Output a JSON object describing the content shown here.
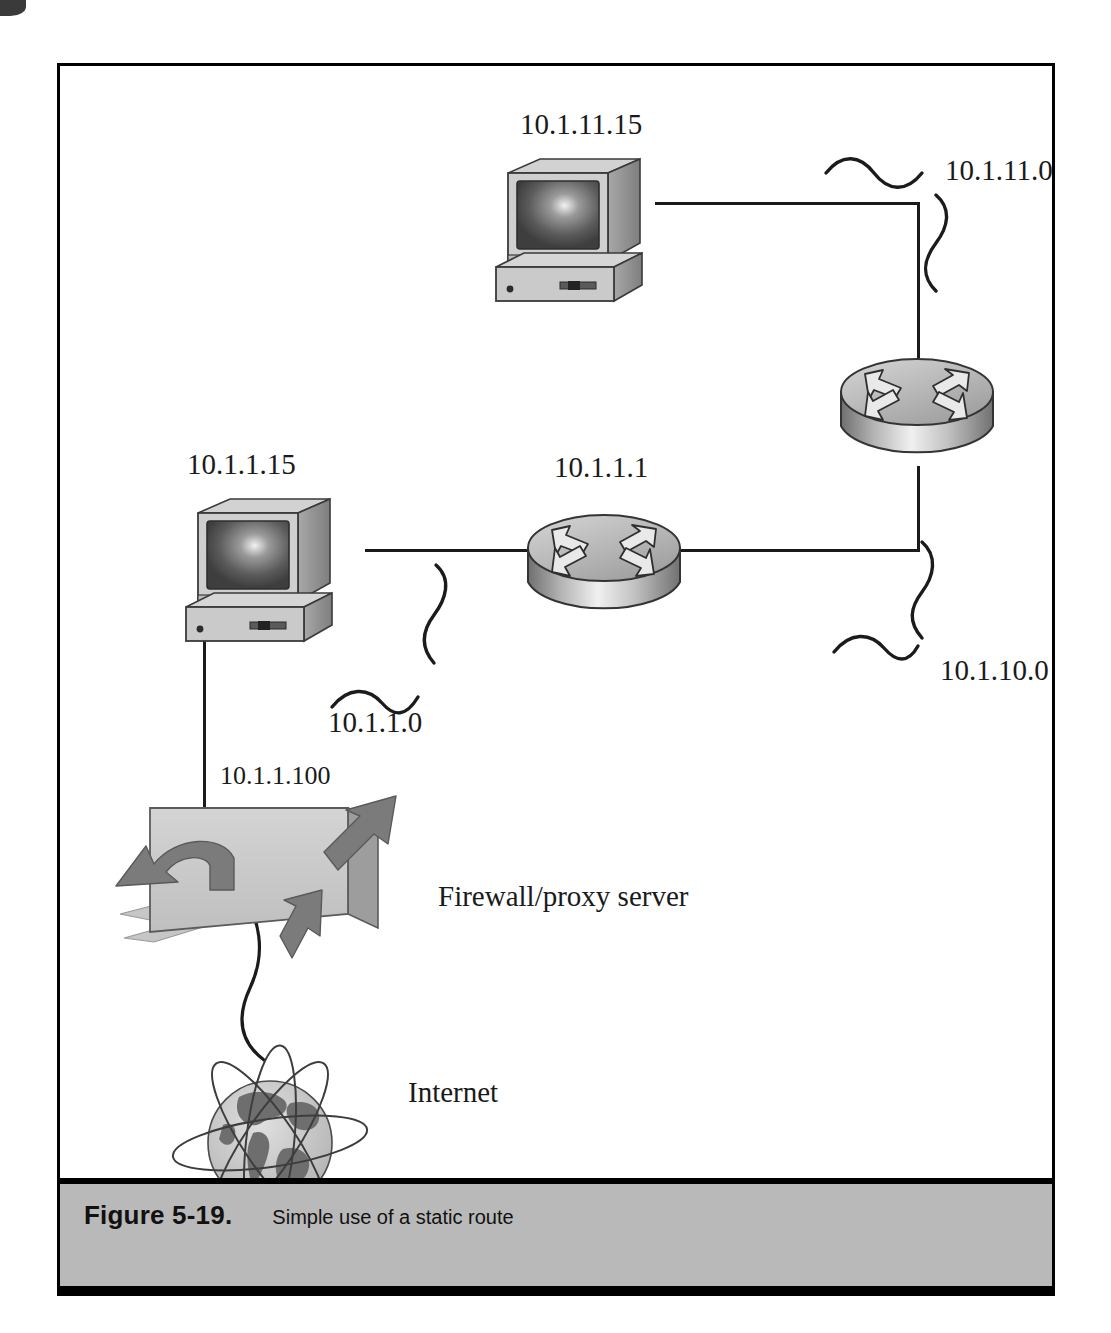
{
  "figure": {
    "number_label": "Figure 5-19.",
    "caption": "Simple use of a static route"
  },
  "diagram": {
    "title": "Simple use of a static route",
    "type": "network-topology",
    "nodes": [
      {
        "id": "pc-top",
        "kind": "workstation",
        "label": "10.1.11.15"
      },
      {
        "id": "router-top",
        "kind": "router",
        "label": ""
      },
      {
        "id": "pc-left",
        "kind": "workstation",
        "label": "10.1.1.15"
      },
      {
        "id": "router-mid",
        "kind": "router",
        "label": "10.1.1.1"
      },
      {
        "id": "firewall",
        "kind": "firewall-proxy",
        "label": "Firewall/proxy server",
        "ip": "10.1.1.100"
      },
      {
        "id": "internet",
        "kind": "internet-cloud",
        "label": "Internet"
      }
    ],
    "segments": [
      {
        "id": "seg-10-1-11-0",
        "label": "10.1.11.0"
      },
      {
        "id": "seg-10-1-1-0",
        "label": "10.1.1.0"
      },
      {
        "id": "seg-10-1-10-0",
        "label": "10.1.10.0"
      }
    ],
    "labels": {
      "pc_top_ip": "10.1.11.15",
      "router_mid_ip": "10.1.1.1",
      "pc_left_ip": "10.1.1.15",
      "firewall_ip": "10.1.1.100",
      "firewall_name": "Firewall/proxy server",
      "internet_name": "Internet",
      "net_11": "10.1.11.0",
      "net_1": "10.1.1.0",
      "net_10": "10.1.10.0"
    },
    "colors": {
      "line": "#1b1b1b",
      "caption_bar": "#b9b9b9",
      "device_body": "#c9c9c9",
      "device_shadow": "#8f8f8f",
      "screen_dark": "#4a4a4a",
      "arrow_fill": "#7e7e7e"
    }
  }
}
